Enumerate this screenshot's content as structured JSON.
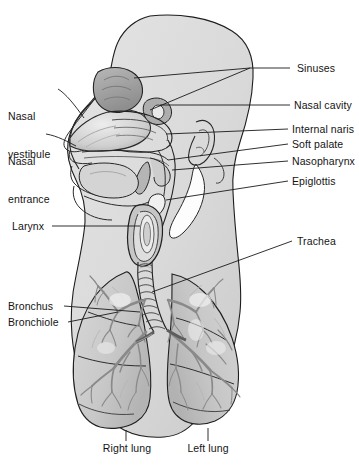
{
  "figure": {
    "width": 359,
    "height": 465,
    "background_color": "#ffffff",
    "line_color": "#1a1a1a",
    "tissue_fill": "#d8d8d8",
    "tissue_fill_dark": "#9a9a9a",
    "lung_fill": "#cfcfcf",
    "bronchial_tree_color": "#8d8d8d",
    "label_color": "#141414"
  },
  "labels": {
    "left": [
      {
        "id": "nasal-vestibule",
        "line1": "Nasal",
        "line2": "vestibule",
        "x": 8,
        "y": 85
      },
      {
        "id": "nasal-entrance",
        "line1": "Nasal",
        "line2": "entrance",
        "x": 8,
        "y": 130
      },
      {
        "id": "larynx",
        "line1": "Larynx",
        "line2": "",
        "x": 12,
        "y": 222
      },
      {
        "id": "bronchus",
        "line1": "Bronchus",
        "line2": "",
        "x": 8,
        "y": 300
      },
      {
        "id": "bronchiole",
        "line1": "Bronchiole",
        "line2": "",
        "x": 8,
        "y": 317
      }
    ],
    "right": [
      {
        "id": "sinuses",
        "text": "Sinuses",
        "x": 297,
        "y": 64
      },
      {
        "id": "nasal-cavity",
        "text": "Nasal cavity",
        "x": 294,
        "y": 101
      },
      {
        "id": "internal-naris",
        "text": "Internal naris",
        "x": 292,
        "y": 125
      },
      {
        "id": "soft-palate",
        "text": "Soft palate",
        "x": 292,
        "y": 140
      },
      {
        "id": "nasopharynx",
        "text": "Nasopharynx",
        "x": 292,
        "y": 157
      },
      {
        "id": "epiglottis",
        "text": "Epiglottis",
        "x": 292,
        "y": 177
      },
      {
        "id": "trachea",
        "text": "Trachea",
        "x": 297,
        "y": 237
      }
    ],
    "bottom": [
      {
        "id": "right-lung",
        "text": "Right lung",
        "x": 108,
        "y": 443
      },
      {
        "id": "left-lung",
        "text": "Left lung",
        "x": 193,
        "y": 443
      }
    ]
  }
}
